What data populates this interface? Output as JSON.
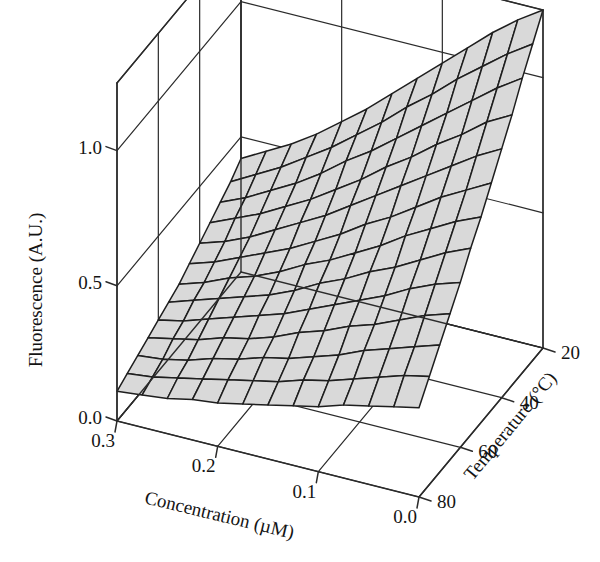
{
  "figure": {
    "background_color": "#ffffff",
    "line_color": "#2b2b2b",
    "surface_fill": "#d9d9d9",
    "surface_line": "#1e1e1e"
  },
  "chart_data": {
    "type": "surface",
    "title": "",
    "xlabel": "Concentration (µM)",
    "ylabel": "Temperature (°C)",
    "zlabel": "Fluorescence (A.U.)",
    "grid": true,
    "legend": "none",
    "xlim": [
      0.0,
      0.3
    ],
    "ylim": [
      20,
      80
    ],
    "zlim": [
      0.0,
      1.25
    ],
    "xticks": [
      "0.3",
      "0.2",
      "0.1",
      "0.0"
    ],
    "xtick_values": [
      0.3,
      0.2,
      0.1,
      0.0
    ],
    "yticks": [
      "20",
      "40",
      "60",
      "80"
    ],
    "ytick_values": [
      20,
      40,
      60,
      80
    ],
    "zticks": [
      "0.0",
      "0.5",
      "1.0"
    ],
    "ztick_values": [
      0.0,
      0.5,
      1.0
    ],
    "x": [
      0.0,
      0.025,
      0.05,
      0.075,
      0.1,
      0.125,
      0.15,
      0.175,
      0.2,
      0.225,
      0.25,
      0.275,
      0.3
    ],
    "y": [
      20,
      25,
      30,
      35,
      40,
      45,
      50,
      55,
      60,
      65,
      70,
      75,
      80
    ],
    "z": [
      [
        1.25,
        1.19,
        1.12,
        1.04,
        0.96,
        0.88,
        0.8,
        0.72,
        0.65,
        0.58,
        0.52,
        0.47,
        0.42
      ],
      [
        1.17,
        1.11,
        1.04,
        0.97,
        0.89,
        0.82,
        0.74,
        0.67,
        0.6,
        0.54,
        0.48,
        0.43,
        0.38
      ],
      [
        1.09,
        1.03,
        0.96,
        0.89,
        0.82,
        0.75,
        0.68,
        0.62,
        0.55,
        0.49,
        0.44,
        0.39,
        0.35
      ],
      [
        1.0,
        0.95,
        0.88,
        0.82,
        0.75,
        0.69,
        0.62,
        0.56,
        0.5,
        0.45,
        0.4,
        0.36,
        0.32
      ],
      [
        0.92,
        0.87,
        0.81,
        0.75,
        0.69,
        0.63,
        0.57,
        0.51,
        0.46,
        0.41,
        0.36,
        0.32,
        0.29
      ],
      [
        0.84,
        0.79,
        0.74,
        0.68,
        0.62,
        0.57,
        0.51,
        0.46,
        0.41,
        0.37,
        0.33,
        0.29,
        0.26
      ],
      [
        0.76,
        0.72,
        0.67,
        0.62,
        0.56,
        0.51,
        0.46,
        0.42,
        0.37,
        0.33,
        0.3,
        0.26,
        0.23
      ],
      [
        0.69,
        0.65,
        0.6,
        0.55,
        0.51,
        0.46,
        0.42,
        0.37,
        0.33,
        0.3,
        0.27,
        0.24,
        0.21
      ],
      [
        0.61,
        0.58,
        0.54,
        0.49,
        0.45,
        0.41,
        0.37,
        0.33,
        0.3,
        0.27,
        0.24,
        0.21,
        0.19
      ],
      [
        0.54,
        0.51,
        0.47,
        0.43,
        0.4,
        0.36,
        0.33,
        0.29,
        0.26,
        0.24,
        0.21,
        0.19,
        0.17
      ],
      [
        0.47,
        0.44,
        0.41,
        0.38,
        0.34,
        0.31,
        0.28,
        0.26,
        0.23,
        0.21,
        0.18,
        0.16,
        0.15
      ],
      [
        0.4,
        0.38,
        0.35,
        0.32,
        0.29,
        0.27,
        0.24,
        0.22,
        0.2,
        0.18,
        0.16,
        0.14,
        0.13
      ],
      [
        0.33,
        0.31,
        0.29,
        0.27,
        0.24,
        0.22,
        0.2,
        0.18,
        0.16,
        0.15,
        0.13,
        0.12,
        0.11
      ]
    ]
  },
  "projection": {
    "origin": [
      419,
      497
    ],
    "x_axis_vector": [
      -302,
      -76
    ],
    "y_axis_vector": [
      124,
      -149
    ],
    "z_axis_vector": [
      0,
      -338
    ],
    "x_floor_edge_note": "0.0 concentration at front-right corner",
    "y_floor_edge_note": "80 C at front-left corner"
  }
}
